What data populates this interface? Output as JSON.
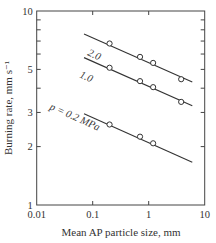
{
  "chart_data": {
    "type": "scatter",
    "scale": {
      "x": "log",
      "y": "log"
    },
    "title": "",
    "xlabel": "Mean AP particle size, mm",
    "ylabel": "Burning rate, mm s⁻¹",
    "xlim": [
      0.01,
      10
    ],
    "ylim": [
      1,
      10
    ],
    "x_ticks": [
      0.01,
      0.1,
      1,
      10
    ],
    "x_tick_labels": [
      "0.01",
      "0.1",
      "1",
      "10"
    ],
    "y_ticks": [
      1,
      2,
      3,
      5,
      10
    ],
    "y_tick_labels": [
      "1",
      "2",
      "3",
      "5",
      "10"
    ],
    "y_minor_ticks": [
      4,
      6,
      7,
      8,
      9
    ],
    "grid": false,
    "legend": "inline labels",
    "series": [
      {
        "name": "2.0",
        "label": "2.0",
        "pressure_MPa": 2.0,
        "points": [
          {
            "x": 0.2,
            "y": 6.8
          },
          {
            "x": 0.7,
            "y": 5.8
          },
          {
            "x": 1.2,
            "y": 5.4
          },
          {
            "x": 3.8,
            "y": 4.45
          }
        ],
        "fit_line": {
          "x_start": 0.07,
          "y_start": 7.6,
          "x_end": 6.0,
          "y_end": 4.3
        }
      },
      {
        "name": "1.0",
        "label": "1.0",
        "pressure_MPa": 1.0,
        "points": [
          {
            "x": 0.2,
            "y": 5.1
          },
          {
            "x": 0.7,
            "y": 4.35
          },
          {
            "x": 1.2,
            "y": 4.05
          },
          {
            "x": 3.8,
            "y": 3.4
          }
        ],
        "fit_line": {
          "x_start": 0.07,
          "y_start": 5.75,
          "x_end": 6.0,
          "y_end": 3.25
        }
      },
      {
        "name": "0.2",
        "label": "p = 0.2 MPa",
        "pressure_MPa": 0.2,
        "points": [
          {
            "x": 0.2,
            "y": 2.6
          },
          {
            "x": 0.7,
            "y": 2.25
          },
          {
            "x": 1.2,
            "y": 2.08
          }
        ],
        "fit_line": {
          "x_start": 0.07,
          "y_start": 2.95,
          "x_end": 6.0,
          "y_end": 1.66
        }
      }
    ]
  }
}
